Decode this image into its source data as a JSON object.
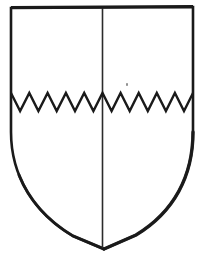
{
  "figure": {
    "kind": "heraldic-shield-line-drawing",
    "title": "Escutcheon party per pale, divided per fess indented",
    "background_color": "#ffffff",
    "ink_color": "#1a1a1a",
    "canvas": {
      "width": 201,
      "height": 263
    },
    "shield": {
      "name": "escutcheon-outline",
      "left": 11,
      "right": 193,
      "top": 7,
      "point_y": 248,
      "point_x": 104,
      "shoulder_y": 132,
      "stroke_width": 2.6,
      "outline_path": "M 11 8 L 11 132 C 11 176 34 213 73 236 L 104 249 L 136 235 C 174 212 193 176 193 132 L 193 7 Z"
    },
    "pale_line": {
      "name": "per-pale-division",
      "x": 102.5,
      "y_top": 8,
      "y_bottom": 248,
      "stroke_width": 1.6,
      "label": "per pale"
    },
    "fess_indented": {
      "name": "per-fess-indented-division",
      "label": "per fess indented",
      "peak_y": 93,
      "valley_y": 111,
      "x_start": 11,
      "x_end": 193,
      "teeth_left": 5,
      "teeth_right": 5,
      "stroke_width": 2.4,
      "path": "M 11 93 L 20 111 L 29 93 L 38 111 L 47 93 L 57 111 L 66 93 L 75 111 L 84 93 L 93 111 L 102 93 L 111 111 L 121 93 L 130 111 L 139 93 L 148 111 L 157 93 L 166 111 L 175 93 L 184 111 L 193 93"
    },
    "specks": [
      {
        "name": "ink-speck",
        "x": 126,
        "y": 83,
        "w": 2,
        "h": 3
      }
    ]
  }
}
